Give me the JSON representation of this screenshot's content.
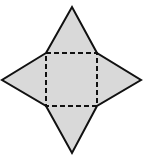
{
  "diagram": {
    "shape": "square-pyramid-net",
    "faces": [
      {
        "id": "base",
        "type": "square",
        "label": ""
      },
      {
        "id": "top",
        "type": "triangle",
        "label": ""
      },
      {
        "id": "left",
        "type": "triangle",
        "label": ""
      },
      {
        "id": "right",
        "type": "triangle",
        "label": ""
      },
      {
        "id": "bottom",
        "type": "triangle",
        "label": ""
      }
    ],
    "fold_lines": "dashed",
    "colors": {
      "fill": "#d9d9d9",
      "stroke": "#111111",
      "background": "#ffffff"
    }
  }
}
